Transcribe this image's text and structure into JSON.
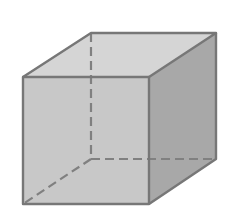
{
  "diagram": {
    "type": "cube",
    "colors": {
      "background": "#ffffff",
      "front_face": "#c8c8c8",
      "top_face": "#d4d4d4",
      "right_face": "#a9a9a9",
      "edge": "#777777",
      "hidden_edge": "#808080"
    },
    "vertices": {
      "front_top_left": [
        23,
        77
      ],
      "front_top_right": [
        149,
        77
      ],
      "front_bottom_right": [
        149,
        204
      ],
      "front_bottom_left": [
        23,
        204
      ],
      "back_top_left": [
        91,
        33
      ],
      "back_top_right": [
        216,
        33
      ],
      "back_bottom_right": [
        216,
        159
      ],
      "back_bottom_left": [
        91,
        159
      ]
    }
  }
}
